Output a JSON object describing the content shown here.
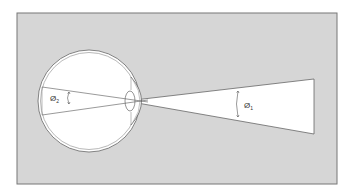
{
  "diagram": {
    "labels": {
      "inner_angle": {
        "symbol": "Ø",
        "subscript": "2"
      },
      "outer_angle": {
        "symbol": "Ø",
        "subscript": "1"
      }
    },
    "colors": {
      "panel": "#d6d6d6",
      "border": "#777777",
      "line": "#555555",
      "cone": "#ffffff"
    }
  }
}
